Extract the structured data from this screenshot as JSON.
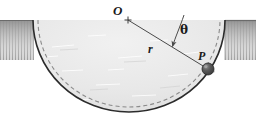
{
  "figure": {
    "background_color": "#ffffff",
    "width": 256,
    "height": 127,
    "ground": {
      "name": "ground-surface",
      "surface_y": 20,
      "left_span_x": [
        0,
        33
      ],
      "right_span_x": [
        225,
        256
      ],
      "fill_color": "#cfcfcf",
      "hatch_color": "#9a9a9a",
      "edge_color": "#4a4a4a"
    },
    "bowl": {
      "name": "hemispherical-bowl",
      "center_x": 129,
      "center_y": 20,
      "radius_x": 96,
      "radius_y": 92,
      "interior_fill": "#e9e9e9",
      "rim_color": "#2b2b2b",
      "rim_width": 1.6,
      "dashed_track_color": "#808080",
      "dashed_pattern": "4 3"
    },
    "center_marker": {
      "name": "center-point-O",
      "x": 128,
      "y": 20,
      "size": 5,
      "color": "#3a3a3a"
    },
    "radius_line": {
      "name": "radius-line",
      "from_x": 128,
      "from_y": 20,
      "to_x": 208,
      "to_y": 69,
      "color": "#4a4a4a",
      "width": 1
    },
    "vertical_reference": {
      "name": "vertical-reference-line",
      "from_x": 183,
      "from_y": 16,
      "to_x": 172,
      "to_y": 48,
      "color": "#4a4a4a",
      "width": 1,
      "arrow": "pointing-to-radius"
    },
    "particle": {
      "name": "particle-P",
      "x": 208,
      "y": 69,
      "radius": 6,
      "fill_color": "#4d4d4d",
      "highlight_color": "#8c8c8c",
      "outline_color": "#262626"
    },
    "labels": {
      "center": "O",
      "radius": "r",
      "particle": "P",
      "angle": "θ"
    }
  }
}
